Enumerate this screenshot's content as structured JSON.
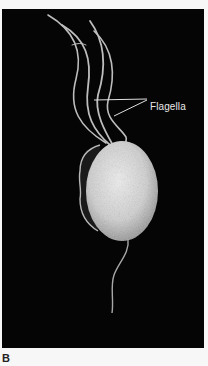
{
  "figure": {
    "panel_letter": "B",
    "annotations": [
      {
        "label": "Flagella"
      }
    ],
    "colors": {
      "background": "#050505",
      "cell": "#d9d9d9",
      "page": "#f7f7f7"
    }
  }
}
